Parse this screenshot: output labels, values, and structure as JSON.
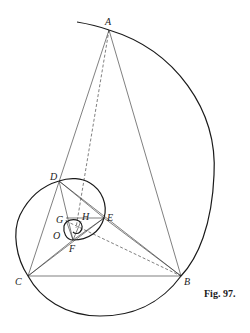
{
  "figure": {
    "caption": "Fig. 97.",
    "points": {
      "A": {
        "label": "A",
        "x": 109,
        "y": 30
      },
      "B": {
        "label": "B",
        "x": 181,
        "y": 276
      },
      "C": {
        "label": "C",
        "x": 28,
        "y": 276
      },
      "D": {
        "label": "D",
        "x": 59,
        "y": 181
      },
      "E": {
        "label": "E",
        "x": 104,
        "y": 218
      },
      "F": {
        "label": "F",
        "x": 73,
        "y": 240
      },
      "G": {
        "label": "G",
        "x": 68,
        "y": 221
      },
      "H": {
        "label": "H",
        "x": 80,
        "y": 221
      },
      "O": {
        "label": "O",
        "x": 72,
        "y": 232
      }
    },
    "colors": {
      "ink": "#1a1a1a",
      "paper": "#ffffff"
    }
  }
}
